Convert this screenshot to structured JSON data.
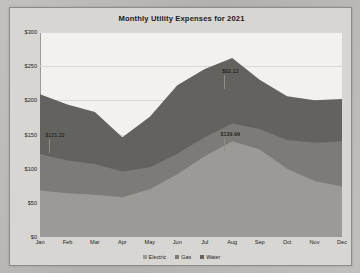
{
  "chart_data": {
    "type": "area",
    "stacked": true,
    "title": "Monthly Utility Expenses for 2021",
    "xlabel": "",
    "ylabel": "",
    "ylim": [
      0,
      300
    ],
    "yticks": [
      "$0",
      "$50",
      "$100",
      "$150",
      "$200",
      "$250",
      "$300"
    ],
    "ytick_values": [
      0,
      50,
      100,
      150,
      200,
      250,
      300
    ],
    "grid": true,
    "legend_position": "bottom",
    "categories": [
      "Jan",
      "Feb",
      "Mar",
      "Apr",
      "May",
      "Jun",
      "Jul",
      "Aug",
      "Sep",
      "Oct",
      "Nov",
      "Dec"
    ],
    "series": [
      {
        "name": "Electric",
        "color": "#9b9a96",
        "values": [
          68,
          64,
          62,
          58,
          70,
          92,
          118,
          140,
          128,
          100,
          82,
          74
        ]
      },
      {
        "name": "Gas",
        "color": "#7c7b77",
        "values": [
          53,
          48,
          45,
          38,
          32,
          30,
          28,
          26,
          30,
          42,
          56,
          66
        ]
      },
      {
        "name": "Water",
        "color": "#63625f",
        "values": [
          88,
          82,
          76,
          50,
          74,
          100,
          100,
          96,
          72,
          64,
          62,
          62
        ]
      }
    ],
    "cumulative_tops": [
      209,
      194,
      183,
      146,
      176,
      222,
      246,
      262,
      230,
      206,
      200,
      202
    ],
    "annotations": [
      {
        "label": "$121.32",
        "series": "Electric",
        "category": "Jan",
        "x_pct": 5.0,
        "y_value": 150
      },
      {
        "label": "$82.13",
        "series": "Water",
        "category": "Aug",
        "x_pct": 63.0,
        "y_value": 243
      },
      {
        "label": "$139.99",
        "series": "Gas",
        "category": "Aug",
        "x_pct": 63.0,
        "y_value": 151
      }
    ]
  },
  "legend": {
    "items": [
      {
        "label": "Electric",
        "color": "#9b9a96"
      },
      {
        "label": "Gas",
        "color": "#7c7b77"
      },
      {
        "label": "Water",
        "color": "#63625f"
      }
    ]
  }
}
